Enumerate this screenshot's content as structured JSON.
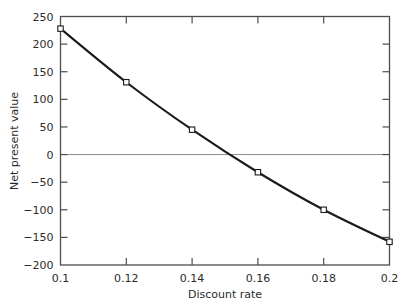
{
  "chart_data": {
    "type": "line",
    "title": "",
    "xlabel": "Discount rate",
    "ylabel": "Net present value",
    "x": [
      0.1,
      0.12,
      0.14,
      0.16,
      0.18,
      0.2
    ],
    "values": [
      228,
      131,
      45,
      -32,
      -100,
      -158
    ],
    "series": [
      {
        "name": "Net present value",
        "values": [
          228,
          131,
          45,
          -32,
          -100,
          -158
        ]
      }
    ],
    "xlim": [
      0.1,
      0.2
    ],
    "ylim": [
      -200,
      250
    ],
    "xticks": [
      0.1,
      0.12,
      0.14,
      0.16,
      0.18,
      0.2
    ],
    "xtick_labels": [
      "0.1",
      "0.12",
      "0.14",
      "0.16",
      "0.18",
      "0.2"
    ],
    "yticks": [
      -200,
      -150,
      -100,
      -50,
      0,
      50,
      100,
      150,
      200,
      250
    ],
    "ytick_labels": [
      "-200",
      "-150",
      "-100",
      "-50",
      "0",
      "50",
      "100",
      "150",
      "200",
      "250"
    ],
    "grid": false,
    "zero_reference_line": 0,
    "legend": "none",
    "marker": "open-square",
    "line_color": "#1a1a1a",
    "marker_face_color": "#ffffff",
    "marker_edge_color": "#1a1a1a",
    "zero_line_color": "#8c8c8c",
    "axis_color": "#4d4d4d",
    "background_color": "#ffffff"
  }
}
